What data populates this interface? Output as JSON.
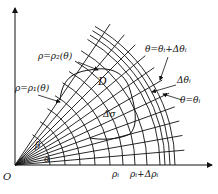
{
  "diagram": {
    "origin_label": "O",
    "region_label": "D",
    "area_element_label": "Δσ",
    "angle_alpha_label": "α",
    "angle_beta_label": "β",
    "curve_outer_label": "ρ=ρ₂(θ)",
    "curve_inner_label": "ρ=ρ₁(θ)",
    "ray_upper_label": "θ=θᵢ+Δθᵢ",
    "ray_lower_label": "θ=θᵢ",
    "delta_theta_label": "Δθᵢ",
    "rho_i_label": "ρᵢ",
    "rho_i_plus_label": "ρᵢ+Δρᵢ",
    "colors": {
      "line": "#111111",
      "background": "#ffffff"
    },
    "geometry": {
      "origin": [
        15,
        165
      ],
      "alpha_deg": 5,
      "beta_deg": 56,
      "ray_angles_deg": [
        5,
        10,
        15,
        20,
        25,
        30,
        35,
        40,
        45,
        50,
        56
      ],
      "arc_radii": [
        35,
        50,
        65,
        80,
        95,
        108,
        120,
        132,
        145,
        150,
        155,
        160
      ],
      "ray_length": 170
    }
  }
}
